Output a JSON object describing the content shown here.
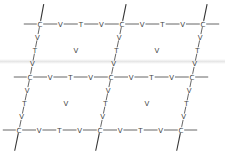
{
  "diagram": {
    "type": "lattice",
    "colors": {
      "line": "#555555",
      "text": "#444444",
      "background": "#ffffff"
    },
    "corners": [
      {
        "id": "c00",
        "label": "C",
        "x": 40,
        "y": 24
      },
      {
        "id": "c01",
        "label": "C",
        "x": 122,
        "y": 24
      },
      {
        "id": "c02",
        "label": "C",
        "x": 203,
        "y": 24
      },
      {
        "id": "c10",
        "label": "C",
        "x": 30,
        "y": 77
      },
      {
        "id": "c11",
        "label": "C",
        "x": 111,
        "y": 77
      },
      {
        "id": "c12",
        "label": "C",
        "x": 192,
        "y": 77
      },
      {
        "id": "c20",
        "label": "C",
        "x": 19,
        "y": 130
      },
      {
        "id": "c21",
        "label": "C",
        "x": 100,
        "y": 130
      },
      {
        "id": "c22",
        "label": "C",
        "x": 181,
        "y": 130
      }
    ],
    "edge_sequence": [
      "V",
      "T",
      "V"
    ],
    "edges": [
      [
        "c00",
        "c01"
      ],
      [
        "c01",
        "c02"
      ],
      [
        "c10",
        "c11"
      ],
      [
        "c11",
        "c12"
      ],
      [
        "c20",
        "c21"
      ],
      [
        "c21",
        "c22"
      ],
      [
        "c00",
        "c10"
      ],
      [
        "c10",
        "c20"
      ],
      [
        "c01",
        "c11"
      ],
      [
        "c11",
        "c21"
      ],
      [
        "c02",
        "c12"
      ],
      [
        "c12",
        "c22"
      ]
    ],
    "cell_centers": [
      {
        "label": "V",
        "x": 76,
        "y": 50
      },
      {
        "label": "V",
        "x": 157,
        "y": 50
      },
      {
        "label": "V",
        "x": 66,
        "y": 103
      },
      {
        "label": "V",
        "x": 147,
        "y": 103
      }
    ],
    "stubs": {
      "horizontal_length": 13,
      "vertical_top_length": 17,
      "vertical_bottom_length": 18
    }
  }
}
